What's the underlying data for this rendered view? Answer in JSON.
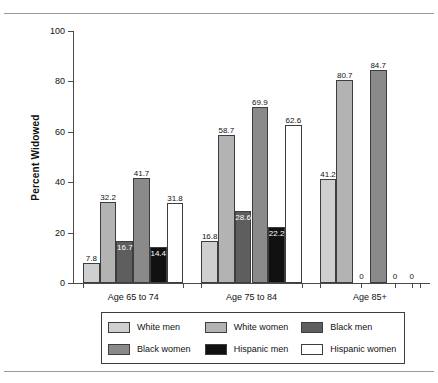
{
  "chart_data": {
    "type": "bar",
    "title": "",
    "xlabel": "",
    "ylabel": "Percent Widowed",
    "ylim": [
      0,
      100
    ],
    "yticks": [
      0,
      20,
      40,
      60,
      80,
      100
    ],
    "grid": false,
    "legend_position": "bottom",
    "categories": [
      "Age 65 to 74",
      "Age 75 to 84",
      "Age 85+"
    ],
    "series": [
      {
        "name": "White men",
        "color": "#cfcfcf",
        "values": [
          7.8,
          16.8,
          41.2
        ]
      },
      {
        "name": "White women",
        "color": "#b3b3b3",
        "values": [
          32.2,
          58.7,
          80.7
        ]
      },
      {
        "name": "Black men",
        "color": "#5e5e5e",
        "values": [
          16.7,
          28.6,
          0
        ]
      },
      {
        "name": "Black women",
        "color": "#8a8a8a",
        "values": [
          41.7,
          69.9,
          84.7
        ]
      },
      {
        "name": "Hispanic men",
        "color": "#111111",
        "values": [
          14.4,
          22.2,
          0
        ]
      },
      {
        "name": "Hispanic women",
        "color": "#ffffff",
        "values": [
          31.8,
          62.6,
          0
        ]
      }
    ],
    "value_labels": [
      [
        "7.8",
        "32.2",
        "16.7",
        "41.7",
        "14.4",
        "31.8"
      ],
      [
        "16.8",
        "58.7",
        "28.6",
        "69.9",
        "22.2",
        "62.6"
      ],
      [
        "41.2",
        "80.7",
        "0",
        "84.7",
        "0",
        "0"
      ]
    ]
  },
  "axis": {
    "y_tick_labels": [
      "0",
      "20",
      "40",
      "60",
      "80",
      "100"
    ],
    "y_title": "Percent Widowed"
  },
  "legend": {
    "items": [
      {
        "label": "White men",
        "color": "#cfcfcf"
      },
      {
        "label": "White women",
        "color": "#b3b3b3"
      },
      {
        "label": "Black men",
        "color": "#5e5e5e"
      },
      {
        "label": "Black women",
        "color": "#8a8a8a"
      },
      {
        "label": "Hispanic men",
        "color": "#111111"
      },
      {
        "label": "Hispanic women",
        "color": "#ffffff"
      }
    ]
  }
}
